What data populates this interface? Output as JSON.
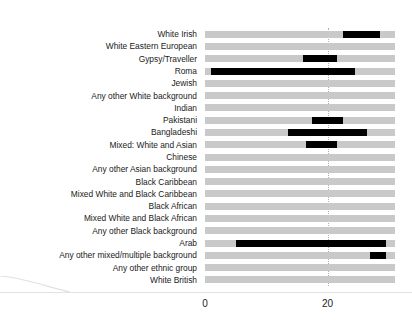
{
  "chart_data": {
    "type": "bar",
    "orientation": "horizontal",
    "title": "",
    "subtitle": "",
    "xlabel": "",
    "ylabel": "",
    "xlim": [
      0,
      31
    ],
    "xticks": [
      0,
      20
    ],
    "xtick_labels": [
      "0",
      "20"
    ],
    "grid": "vertical-dotted-at-20",
    "legend": "none",
    "background_series_name": "All categories (light grey background bar)",
    "value_series_name": "Value (black bar)",
    "categories": [
      "White Irish",
      "White Eastern European",
      "Gypsy/Traveller",
      "Roma",
      "Jewish",
      "Any other White background",
      "Indian",
      "Pakistani",
      "Bangladeshi",
      "Mixed: White and Asian",
      "Chinese",
      "Any other Asian background",
      "Black Caribbean",
      "Mixed White and Black Caribbean",
      "Black African",
      "Mixed White and Black African",
      "Any other Black background",
      "Arab",
      "Any other mixed/multiple background",
      "Any other ethnic group",
      "White British"
    ],
    "values": [
      28.5,
      0,
      21.5,
      24.5,
      0,
      0,
      0,
      22.5,
      26.5,
      21.5,
      0,
      0,
      0,
      0,
      0,
      0,
      0,
      29.5,
      29.5,
      0,
      0
    ],
    "background_values": [
      31,
      31,
      31,
      31,
      31,
      31,
      31,
      31,
      31,
      31,
      31,
      31,
      31,
      31,
      31,
      31,
      31,
      31,
      31,
      31,
      31
    ],
    "bar_starts": [
      22.5,
      0,
      16.0,
      1.0,
      0,
      0,
      0,
      17.5,
      13.5,
      16.5,
      0,
      0,
      0,
      0,
      0,
      0,
      0,
      5.0,
      27.0,
      0,
      0
    ],
    "colors": {
      "value_bar": "#000000",
      "background_bar": "#c9c9c9",
      "gridline": "#b0b0b0",
      "text": "#1a1a1a",
      "baseline": "#e2e2e2"
    }
  }
}
